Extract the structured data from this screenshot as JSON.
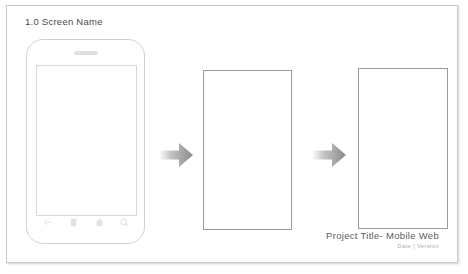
{
  "slide": {
    "screen_title": "1.0 Screen Name",
    "background_color": "#ffffff",
    "border_color": "#c9c9c9"
  },
  "phone": {
    "label": "mobile-device-mockup",
    "frame_color": "#d2d2d2",
    "screen_color": "#ffffff",
    "speaker": "speaker-grille",
    "nav_icons": [
      {
        "name": "back-arrow-icon",
        "label": "Back"
      },
      {
        "name": "menu-icon",
        "label": "Menu"
      },
      {
        "name": "home-icon",
        "label": "Home"
      },
      {
        "name": "search-icon",
        "label": "Search"
      }
    ]
  },
  "flow": {
    "arrows": [
      {
        "name": "flow-arrow-1",
        "direction": "right"
      },
      {
        "name": "flow-arrow-2",
        "direction": "right"
      }
    ],
    "arrow_color": "#8f8f8f",
    "frames": [
      {
        "name": "screen-frame-2",
        "content": ""
      },
      {
        "name": "screen-frame-3",
        "content": ""
      }
    ],
    "frame_border_color": "#9a9a9a"
  },
  "caption": {
    "title": "Project Title- Mobile Web",
    "subtitle": "Date  |  Version",
    "title_color": "#5b5b5b",
    "subtitle_color": "#a9a9a9"
  }
}
